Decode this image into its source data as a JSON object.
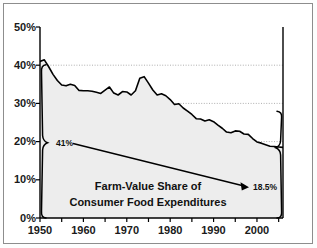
{
  "chart_data": {
    "type": "line",
    "title": "Farm-Value Share of Consumer Food Expenditures",
    "title_line1": "Farm-Value Share of",
    "title_line2": "Consumer Food Expenditures",
    "xlabel": "",
    "ylabel": "",
    "xlim": [
      1950,
      2006
    ],
    "ylim": [
      0,
      50
    ],
    "grid": true,
    "grid_axis": "y",
    "grid_style": "dotted",
    "legend": "none",
    "y_tick_labels": [
      "0%",
      "10%",
      "20%",
      "30%",
      "40%",
      "50%"
    ],
    "y_ticks": [
      0,
      10,
      20,
      30,
      40,
      50
    ],
    "x_tick_labels": [
      "1950",
      "1960",
      "1970",
      "1980",
      "1990",
      "2000"
    ],
    "x_ticks": [
      1950,
      1960,
      1970,
      1980,
      1990,
      2000
    ],
    "x_minor_ticks": [
      1955,
      1965,
      1975,
      1985,
      1995,
      2005
    ],
    "area_fill": true,
    "series": [
      {
        "name": "Farm-Value Share",
        "x": [
          1950,
          1951,
          1952,
          1953,
          1954,
          1955,
          1956,
          1957,
          1958,
          1959,
          1960,
          1961,
          1962,
          1963,
          1964,
          1965,
          1966,
          1967,
          1968,
          1969,
          1970,
          1971,
          1972,
          1973,
          1974,
          1975,
          1976,
          1977,
          1978,
          1979,
          1980,
          1981,
          1982,
          1983,
          1984,
          1985,
          1986,
          1987,
          1988,
          1989,
          1990,
          1991,
          1992,
          1993,
          1994,
          1995,
          1996,
          1997,
          1998,
          1999,
          2000,
          2001,
          2002,
          2003,
          2004,
          2005,
          2006
        ],
        "values": [
          41.0,
          41.4,
          39.6,
          37.6,
          36.0,
          34.8,
          34.6,
          35.0,
          34.7,
          33.4,
          33.3,
          33.3,
          33.2,
          32.9,
          32.6,
          33.5,
          34.3,
          32.7,
          32.2,
          33.1,
          33.0,
          32.2,
          33.3,
          36.6,
          37.0,
          35.3,
          33.5,
          32.2,
          32.5,
          32.0,
          31.0,
          29.7,
          29.9,
          28.8,
          28.0,
          27.1,
          26.0,
          25.9,
          25.4,
          25.7,
          25.2,
          24.3,
          23.5,
          22.5,
          22.3,
          22.8,
          22.7,
          22.0,
          21.9,
          20.8,
          19.9,
          19.6,
          19.2,
          18.8,
          18.7,
          18.6,
          18.5
        ]
      }
    ],
    "annotations": [
      {
        "id": "start-value",
        "label": "41%",
        "x": 1950,
        "y": 41.0,
        "note": "left brace value, start of series"
      },
      {
        "id": "end-value",
        "label": "18.5%",
        "x": 2006,
        "y": 18.5,
        "note": "right brace value, end of series"
      }
    ],
    "trend_arrow": {
      "from_label": "41%",
      "to_label": "18.5%",
      "description": "arrow from 41% annotation down to 18.5% annotation"
    },
    "braces": [
      {
        "id": "left-brace",
        "from": 0,
        "to": 41.0,
        "at_x": 1950,
        "label": "41%"
      },
      {
        "id": "right-brace",
        "from": 0,
        "to": 18.5,
        "at_x": 2006,
        "label": "18.5%"
      }
    ]
  },
  "colors": {
    "line": "#000000",
    "fill": "#ededed",
    "grid": "#9a9a9a",
    "axis": "#000000",
    "frame": "#8d8d8d",
    "text": "#111111",
    "background": "#ffffff"
  }
}
